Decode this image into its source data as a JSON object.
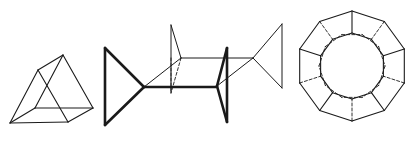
{
  "figure": {
    "background": "#ffffff",
    "stroke_color": "#1a1a1a",
    "panels": [
      {
        "name": "triangular-prism",
        "description": "Wireframe triangular prism",
        "lines": [
          [
            10,
            123,
            38,
            70
          ],
          [
            38,
            70,
            68,
            122
          ],
          [
            10,
            123,
            68,
            122
          ],
          [
            38,
            70,
            63,
            55
          ],
          [
            63,
            55,
            93,
            108
          ],
          [
            68,
            122,
            93,
            108
          ],
          [
            10,
            123,
            35,
            108
          ],
          [
            35,
            108,
            93,
            108
          ],
          [
            35,
            108,
            63,
            55
          ]
        ]
      },
      {
        "name": "linked-triangles",
        "description": "Bold and thin triangles joined by a plane",
        "bold_lines": [
          [
            105,
            48,
            105,
            125
          ],
          [
            105,
            48,
            144,
            87
          ],
          [
            105,
            125,
            144,
            87
          ],
          [
            144,
            87,
            217,
            87
          ],
          [
            227,
            48,
            227,
            122
          ],
          [
            227,
            48,
            217,
            86
          ],
          [
            227,
            122,
            217,
            86
          ]
        ],
        "thin_lines": [
          [
            144,
            87,
            181,
            58
          ],
          [
            171,
            25,
            181,
            58
          ],
          [
            171,
            25,
            171,
            93
          ],
          [
            181,
            58,
            253,
            58
          ],
          [
            217,
            86,
            253,
            58
          ],
          [
            253,
            58,
            282,
            24
          ],
          [
            253,
            58,
            282,
            88
          ],
          [
            282,
            24,
            282,
            88
          ]
        ],
        "dashed_lines": [
          [
            181,
            58,
            171,
            93
          ],
          [
            171,
            58,
            171,
            93
          ]
        ]
      },
      {
        "name": "decagonal-ring",
        "description": "Decagonal ring with inner polygons",
        "center": [
          352,
          66
        ],
        "outer_radius": 55,
        "inner_radius": 33,
        "dashed_radius": 33,
        "sides": 10
      }
    ]
  }
}
